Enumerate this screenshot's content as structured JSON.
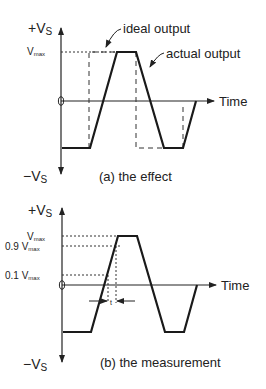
{
  "diagram_a": {
    "y_top_label": "+V",
    "y_top_sub": "S",
    "y_bottom_label": "−V",
    "y_bottom_sub": "S",
    "origin_label": "0",
    "x_label": "Time",
    "vmax_label": "V",
    "vmax_sub": "max",
    "ideal_label": "ideal output",
    "actual_label": "actual output",
    "caption": "(a) the effect"
  },
  "diagram_b": {
    "y_top_label": "+V",
    "y_top_sub": "S",
    "y_bottom_label": "−V",
    "y_bottom_sub": "S",
    "origin_label": "0",
    "x_label": "Time",
    "levels": [
      {
        "prefix": "V",
        "sub": "max"
      },
      {
        "prefix": "0.9 V",
        "sub": "max"
      },
      {
        "prefix": "0.1 V",
        "sub": "max"
      }
    ],
    "rise_time_label": "t",
    "caption": "(b) the measurement"
  }
}
